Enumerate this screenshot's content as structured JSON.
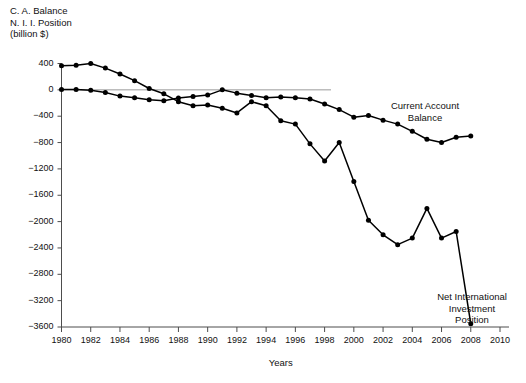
{
  "figure": {
    "axis_label_block": "C. A. Balance\nN. I. I. Position\n(billion $)",
    "xaxis_title": "Years",
    "annotation_ca": "Current Account\nBalance",
    "annotation_niip": "Net International\nInvestment\nPosition",
    "line_color": "#000000",
    "marker_color": "#000000",
    "zero_line_color": "#9a9a9a",
    "axis_color": "#4d4d4d"
  },
  "chart_data": {
    "type": "line",
    "title": "",
    "xlabel": "Years",
    "ylabel": "C. A. Balance / N. I. I. Position (billion $)",
    "xlim": [
      1979,
      2011
    ],
    "ylim": [
      -3600,
      400
    ],
    "yticks": [
      400,
      0,
      -400,
      -800,
      -1200,
      -1600,
      -2000,
      -2400,
      -2800,
      -3200,
      -3600
    ],
    "ytick_labels": [
      "400",
      "0",
      "-400",
      "-800",
      "-1200",
      "-1600",
      "-2000",
      "-2400",
      "-2800",
      "-3200",
      "-3600"
    ],
    "xticks": [
      1980,
      1982,
      1984,
      1986,
      1988,
      1990,
      1992,
      1994,
      1996,
      1998,
      2000,
      2002,
      2004,
      2006,
      2008,
      2010
    ],
    "xtick_labels": [
      "1980",
      "1982",
      "1984",
      "1986",
      "1988",
      "1990",
      "1992",
      "1994",
      "1996",
      "1998",
      "2000",
      "2002",
      "2004",
      "2006",
      "2008",
      "2010"
    ],
    "grid": false,
    "zero_reference_line": true,
    "legend": "annotations",
    "series": [
      {
        "name": "Net International Investment Position",
        "x": [
          1980,
          1981,
          1982,
          1983,
          1984,
          1985,
          1986,
          1987,
          1988,
          1989,
          1990,
          1991,
          1992,
          1993,
          1994,
          1995,
          1996,
          1997,
          1998,
          1999,
          2000,
          2001,
          2002,
          2003,
          2004,
          2005,
          2006,
          2007,
          2008
        ],
        "values": [
          365,
          375,
          400,
          330,
          240,
          140,
          20,
          -60,
          -180,
          -240,
          -230,
          -280,
          -350,
          -180,
          -240,
          -470,
          -520,
          -820,
          -1080,
          -800,
          -1390,
          -1980,
          -2200,
          -2350,
          -2250,
          -1800,
          -2250,
          -2150,
          -3550
        ]
      },
      {
        "name": "Current Account Balance",
        "x": [
          1980,
          1981,
          1982,
          1983,
          1984,
          1985,
          1986,
          1987,
          1988,
          1989,
          1990,
          1991,
          1992,
          1993,
          1994,
          1995,
          1996,
          1997,
          1998,
          1999,
          2000,
          2001,
          2002,
          2003,
          2004,
          2005,
          2006,
          2007,
          2008
        ],
        "values": [
          5,
          5,
          -5,
          -40,
          -95,
          -120,
          -150,
          -165,
          -125,
          -100,
          -80,
          0,
          -50,
          -85,
          -120,
          -110,
          -120,
          -140,
          -215,
          -300,
          -415,
          -390,
          -460,
          -520,
          -630,
          -750,
          -800,
          -720,
          -700
        ]
      }
    ]
  }
}
